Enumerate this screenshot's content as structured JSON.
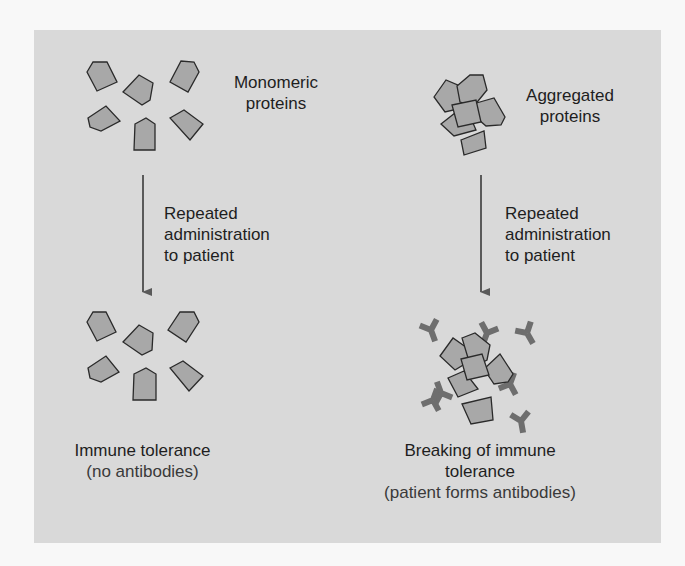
{
  "diagram": {
    "colors": {
      "panel": "#d9d9d9",
      "protein_fill": "#a8a8a8",
      "protein_stroke": "#2a2a2a",
      "antibody": "#6e6e6e",
      "arrow": "#5a5a5a"
    },
    "left": {
      "top_label": [
        "Monomeric",
        "proteins"
      ],
      "arrow_label": [
        "Repeated",
        "administration",
        "to patient"
      ],
      "result_title": "Immune tolerance",
      "result_sub": "(no antibodies)"
    },
    "right": {
      "top_label": [
        "Aggregated",
        "proteins"
      ],
      "arrow_label": [
        "Repeated",
        "administration",
        "to patient"
      ],
      "result_title": [
        "Breaking of immune",
        "tolerance"
      ],
      "result_sub": "(patient forms antibodies)"
    }
  }
}
